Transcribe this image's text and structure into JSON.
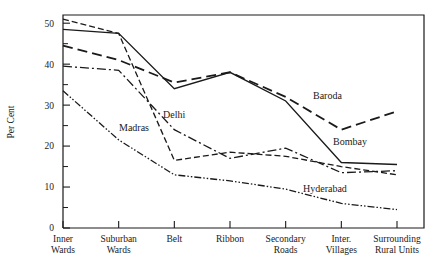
{
  "chart_data": {
    "type": "line",
    "title": "",
    "xlabel": "",
    "ylabel": "Per Cent",
    "ylim": [
      0,
      52
    ],
    "yticks": [
      0,
      10,
      20,
      30,
      40,
      50
    ],
    "yticks_minor": [
      5,
      15,
      25,
      35,
      45
    ],
    "grid": false,
    "legend_position": "inline-annotations",
    "categories": [
      "Inner Wards",
      "Suburban Wards",
      "Belt",
      "Ribbon",
      "Secondary Roads",
      "Inter. Villages",
      "Surrounding Rural Units"
    ],
    "categories_lines": [
      [
        "Inner",
        "Wards"
      ],
      [
        "Suburban",
        "Wards"
      ],
      [
        "Belt",
        ""
      ],
      [
        "Ribbon",
        ""
      ],
      [
        "Secondary",
        "Roads"
      ],
      [
        "Inter.",
        "Villages"
      ],
      [
        "Surrounding",
        "Rural Units"
      ]
    ],
    "series": [
      {
        "name": "Madras",
        "dash": "6,3",
        "width": 1.3,
        "values": [
          51.0,
          47.5,
          16.5,
          18.5,
          17.5,
          15.0,
          13.0
        ],
        "label": {
          "text": "Madras",
          "x": 119,
          "y": 131
        }
      },
      {
        "name": "Bombay",
        "dash": "none",
        "width": 1.3,
        "values": [
          48.5,
          47.5,
          34.0,
          38.0,
          31.0,
          16.0,
          15.5
        ],
        "label": {
          "text": "Bombay",
          "x": 333,
          "y": 145
        }
      },
      {
        "name": "Baroda",
        "dash": "10,5",
        "width": 1.8,
        "values": [
          44.5,
          41.0,
          35.5,
          38.0,
          32.0,
          24.0,
          28.5
        ],
        "label": {
          "text": "Baroda",
          "x": 313,
          "y": 99
        }
      },
      {
        "name": "Delhi",
        "dash": "9,3,2,3",
        "width": 1.3,
        "values": [
          39.5,
          38.5,
          24.0,
          17.0,
          19.5,
          13.5,
          14.0
        ],
        "label": {
          "text": "Delhi",
          "x": 163,
          "y": 118
        }
      },
      {
        "name": "Hyderabad",
        "dash": "7,2,1.5,2,1.5,2",
        "width": 1.3,
        "values": [
          33.5,
          21.5,
          13.0,
          11.5,
          9.5,
          6.0,
          4.5
        ],
        "label": {
          "text": "Hyderabad",
          "x": 303,
          "y": 192
        }
      }
    ]
  }
}
